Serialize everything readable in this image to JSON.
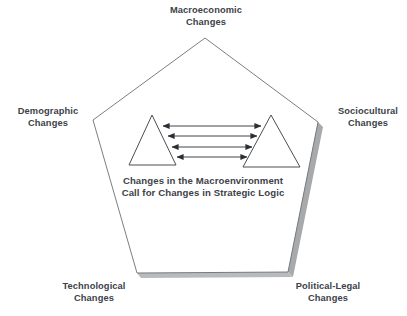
{
  "figure": {
    "background_color": "#ffffff",
    "line_color": "#6b6f74",
    "shadow_color": "#a8a9ab",
    "text_color": "#3d4248",
    "arrow_color": "#2b2f33"
  },
  "vertices": [
    {
      "id": "macroeconomic",
      "line1": "Macroeconomic",
      "line2": "Changes"
    },
    {
      "id": "demographic",
      "line1": "Demographic",
      "line2": "Changes"
    },
    {
      "id": "sociocultural",
      "line1": "Sociocultural",
      "line2": "Changes"
    },
    {
      "id": "technological",
      "line1": "Technological",
      "line2": "Changes"
    },
    {
      "id": "political_legal",
      "line1": "Political-Legal",
      "line2": "Changes"
    }
  ],
  "center_caption": {
    "line1": "Changes in the Macroenvironment",
    "line2": "Call for Changes in Strategic Logic"
  },
  "shapes": {
    "pentagon": {
      "points": "205,38 93,120 137,273 288,272 318,122",
      "stroke": "#6b6f74",
      "fill": "none",
      "stroke_width": 0.9
    },
    "left_triangle": {
      "points": "152,115 176,165 129,165",
      "stroke": "#4a4e53",
      "fill": "none",
      "stroke_width": 1
    },
    "right_triangle": {
      "points": "271,115 300,167 243,167",
      "stroke": "#4a4e53",
      "fill": "none",
      "stroke_width": 1
    }
  },
  "arrows": [
    {
      "id": "arrow-1",
      "x1": 163,
      "y1": 126,
      "x2": 261,
      "y2": 126
    },
    {
      "id": "arrow-2",
      "x1": 168,
      "y1": 136,
      "x2": 257,
      "y2": 136
    },
    {
      "id": "arrow-3",
      "x1": 172,
      "y1": 147,
      "x2": 252,
      "y2": 147
    },
    {
      "id": "arrow-4",
      "x1": 177,
      "y1": 157,
      "x2": 247,
      "y2": 157
    }
  ]
}
